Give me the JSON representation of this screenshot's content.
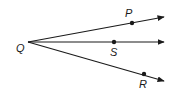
{
  "diagram": {
    "type": "rays-from-common-endpoint",
    "vertex": {
      "label": "Q",
      "x": 28,
      "y": 42,
      "label_x": 16,
      "label_y": 52
    },
    "rays": [
      {
        "name": "QP",
        "point": {
          "label": "P",
          "x": 132,
          "y": 23,
          "label_x": 125,
          "label_y": 17
        },
        "end": {
          "x": 164,
          "y": 17
        }
      },
      {
        "name": "QS",
        "point": {
          "label": "S",
          "x": 114,
          "y": 42,
          "label_x": 110,
          "label_y": 56
        },
        "end": {
          "x": 164,
          "y": 42
        }
      },
      {
        "name": "QR",
        "point": {
          "label": "R",
          "x": 144,
          "y": 74,
          "label_x": 139,
          "label_y": 88
        },
        "end": {
          "x": 164,
          "y": 81
        }
      }
    ],
    "colors": {
      "line": "#1a1a1a",
      "background": "#ffffff"
    }
  }
}
